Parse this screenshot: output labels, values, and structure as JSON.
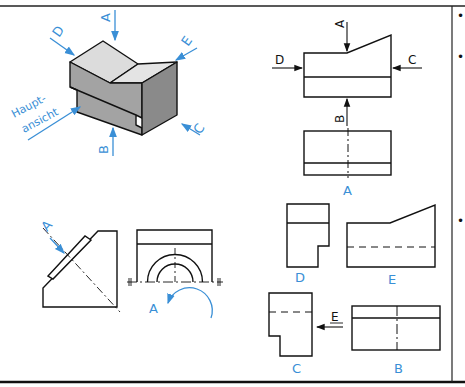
{
  "colors": {
    "accent": "#3a8fd6",
    "line": "#111111",
    "top_face": "#d9d9d9",
    "front_face": "#a3a3a3",
    "side_face": "#8a8a8a"
  },
  "isometric": {
    "main_view_label_line1": "Haupt-",
    "main_view_label_line2": "ansicht",
    "arrow_labels": {
      "A": "A",
      "B": "B",
      "C": "C",
      "D": "D",
      "E": "E"
    }
  },
  "front_view": {
    "arrow_labels": {
      "A": "A",
      "B": "B",
      "C": "C",
      "D": "D"
    }
  },
  "projections": {
    "top_view_label": "A",
    "left_side_view_label": "D",
    "back_view_label": "E",
    "right_side_view_label": "C",
    "bottom_view_label": "B",
    "side_arrow_label": "E"
  },
  "auxiliary": {
    "oblique_arrow_label": "A",
    "rotated_view_label": "A"
  },
  "sidebar": {
    "bullets": [
      "•",
      "•",
      "•"
    ]
  }
}
